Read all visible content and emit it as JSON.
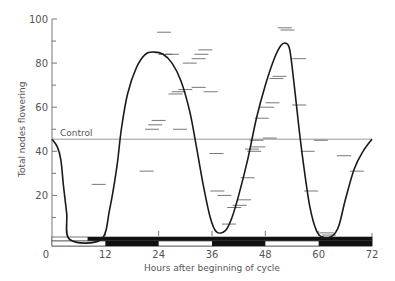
{
  "chart_data": {
    "type": "line",
    "title": "",
    "xlabel": "Hours after beginning of cycle",
    "ylabel": "Total nodes flowering",
    "xlim": [
      0,
      72
    ],
    "ylim": [
      0,
      100
    ],
    "x_ticks": [
      0,
      12,
      24,
      36,
      48,
      60,
      72
    ],
    "x_tick_labels": [
      "0",
      "12",
      "24",
      "36",
      "48",
      "60",
      "72"
    ],
    "y_ticks": [
      20,
      40,
      60,
      80,
      100
    ],
    "y_tick_labels": [
      "20",
      "40",
      "60",
      "80",
      "100"
    ],
    "y_minor_ticks": [
      10,
      30,
      50,
      70,
      90
    ],
    "grid": false,
    "control": {
      "label": "Control",
      "value": 45.5
    },
    "series": [
      {
        "name": "Fitted curve",
        "x": [
          0,
          1,
          2,
          3,
          4,
          5,
          6,
          7,
          8,
          9,
          10,
          11,
          12,
          13,
          14,
          15,
          16,
          17,
          18,
          19,
          20,
          21,
          22,
          23,
          24,
          25,
          26,
          27,
          28,
          29,
          30,
          31,
          32,
          33,
          34,
          35,
          36,
          37,
          38,
          39,
          40,
          41,
          42,
          43,
          44,
          45,
          46,
          47,
          48,
          49,
          50,
          51,
          52,
          53,
          54,
          55,
          56,
          57,
          58,
          59,
          60,
          61,
          62,
          63,
          64,
          65,
          66,
          67,
          68,
          69,
          70,
          71,
          72
        ],
        "y": [
          45.5,
          44,
          40,
          34,
          25,
          14,
          5,
          0,
          0,
          0,
          0,
          0,
          0,
          0,
          0,
          0,
          0,
          0,
          0,
          0,
          0,
          0,
          0,
          0,
          0,
          0,
          0,
          0,
          0,
          0,
          0,
          0,
          0,
          0,
          0,
          0,
          0,
          0,
          0,
          0,
          0,
          0,
          0,
          0,
          0,
          0,
          0,
          0,
          0,
          0,
          0,
          0,
          0,
          0,
          0,
          0,
          0,
          0,
          0,
          0,
          0,
          0,
          0,
          0,
          0,
          0,
          0,
          0,
          0,
          0,
          0,
          0,
          0
        ]
      }
    ],
    "curve_points": [
      [
        0,
        45.5
      ],
      [
        1.2,
        42
      ],
      [
        2,
        36
      ],
      [
        2.6,
        24
      ],
      [
        3.3,
        12
      ],
      [
        4,
        0
      ],
      [
        11,
        0
      ],
      [
        13,
        14
      ],
      [
        14.6,
        33
      ],
      [
        15.6,
        50
      ],
      [
        17,
        66
      ],
      [
        19,
        78
      ],
      [
        21,
        84
      ],
      [
        23,
        85
      ],
      [
        25,
        84
      ],
      [
        27,
        80
      ],
      [
        29,
        72
      ],
      [
        31,
        58
      ],
      [
        32.5,
        42
      ],
      [
        34,
        25
      ],
      [
        35.6,
        10
      ],
      [
        37,
        3.5
      ],
      [
        39,
        4
      ],
      [
        40.5,
        10
      ],
      [
        42,
        20
      ],
      [
        44,
        36
      ],
      [
        46,
        55
      ],
      [
        48,
        70
      ],
      [
        50,
        82
      ],
      [
        51.5,
        88
      ],
      [
        52.6,
        89
      ],
      [
        53.5,
        86
      ],
      [
        54.5,
        70
      ],
      [
        55.6,
        50
      ],
      [
        56.6,
        34
      ],
      [
        58,
        15
      ],
      [
        59.5,
        4
      ],
      [
        61,
        1
      ],
      [
        63,
        1.5
      ],
      [
        64.5,
        6
      ],
      [
        66,
        18
      ],
      [
        68,
        32
      ],
      [
        70,
        40
      ],
      [
        72,
        45.5
      ]
    ],
    "observations": [
      [
        10.5,
        25
      ],
      [
        21.3,
        31
      ],
      [
        22.5,
        50
      ],
      [
        23.2,
        52
      ],
      [
        24,
        54
      ],
      [
        25.2,
        94
      ],
      [
        25.5,
        84
      ],
      [
        27,
        84
      ],
      [
        27.8,
        66
      ],
      [
        28.5,
        67
      ],
      [
        30,
        68
      ],
      [
        31,
        80
      ],
      [
        33,
        69
      ],
      [
        33,
        82
      ],
      [
        33.6,
        84
      ],
      [
        34.5,
        86
      ],
      [
        35.7,
        67
      ],
      [
        28.8,
        50
      ],
      [
        37,
        39
      ],
      [
        37.2,
        22
      ],
      [
        38.8,
        20
      ],
      [
        39.8,
        7
      ],
      [
        41,
        14.5
      ],
      [
        42.2,
        15.5
      ],
      [
        43.2,
        18
      ],
      [
        44,
        28
      ],
      [
        45.5,
        40
      ],
      [
        45,
        41
      ],
      [
        46.4,
        42
      ],
      [
        46,
        45
      ],
      [
        47.2,
        55
      ],
      [
        48.4,
        60
      ],
      [
        49,
        46
      ],
      [
        49.6,
        62
      ],
      [
        50.5,
        73
      ],
      [
        51.2,
        74
      ],
      [
        52.4,
        96
      ],
      [
        53,
        95
      ],
      [
        55.6,
        82
      ],
      [
        55.6,
        61
      ],
      [
        57.5,
        40
      ],
      [
        58.3,
        22
      ],
      [
        60.5,
        45
      ],
      [
        61.8,
        3
      ],
      [
        62.3,
        2
      ],
      [
        65.7,
        38
      ],
      [
        68.6,
        31
      ]
    ],
    "photoperiod_bars": {
      "upper": [
        {
          "start": 0,
          "end": 8,
          "state": "light"
        },
        {
          "start": 8,
          "end": 72,
          "state": "dark"
        }
      ],
      "lower": [
        {
          "start": 0,
          "end": 12,
          "state": "light"
        },
        {
          "start": 12,
          "end": 24,
          "state": "dark"
        },
        {
          "start": 24,
          "end": 36,
          "state": "light"
        },
        {
          "start": 36,
          "end": 48,
          "state": "dark"
        },
        {
          "start": 48,
          "end": 60,
          "state": "light"
        },
        {
          "start": 60,
          "end": 72,
          "state": "dark"
        }
      ]
    }
  }
}
